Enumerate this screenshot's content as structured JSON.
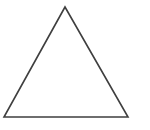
{
  "figure": {
    "name": "triangle",
    "kind": "line-drawing",
    "label": "Triangle",
    "canvas": {
      "width": 150,
      "height": 130,
      "background_color": "#ffffff"
    },
    "shape": {
      "type": "triangle",
      "classification": "isosceles",
      "closed": true,
      "fill_color": "none",
      "stroke_color": "#3f3f3f",
      "stroke_width": 1.6,
      "vertices": [
        {
          "name": "apex",
          "x": 65,
          "y": 7
        },
        {
          "name": "bottom-right",
          "x": 128,
          "y": 117
        },
        {
          "name": "bottom-left",
          "x": 4,
          "y": 117
        }
      ],
      "points": "65,7 128,117 4,117",
      "edges": [
        {
          "name": "left-edge",
          "from": "apex",
          "to": "bottom-left"
        },
        {
          "name": "right-edge",
          "from": "apex",
          "to": "bottom-right"
        },
        {
          "name": "base-edge",
          "from": "bottom-left",
          "to": "bottom-right"
        }
      ],
      "base_width": 124,
      "height": 110
    }
  }
}
